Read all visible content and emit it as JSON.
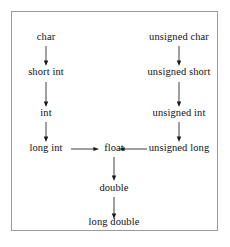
{
  "diagram": {
    "background_color": "#ffffff",
    "border_color": "#9a9a9a",
    "text_color": "#121212",
    "arrow_color": "#2a2a2a",
    "nodes": [
      {
        "id": "char",
        "label": "char",
        "x": 45,
        "y": 40,
        "column": "signed"
      },
      {
        "id": "short_int",
        "label": "short int",
        "x": 45,
        "y": 75,
        "column": "signed"
      },
      {
        "id": "int",
        "label": "int",
        "x": 45,
        "y": 116,
        "column": "signed"
      },
      {
        "id": "long_int",
        "label": "long int",
        "x": 45,
        "y": 151,
        "column": "signed"
      },
      {
        "id": "unsigned_char",
        "label": "unsigned char",
        "x": 178,
        "y": 40,
        "column": "unsigned"
      },
      {
        "id": "unsigned_short",
        "label": "unsigned short",
        "x": 178,
        "y": 75,
        "column": "unsigned"
      },
      {
        "id": "unsigned_int",
        "label": "unsigned int",
        "x": 178,
        "y": 116,
        "column": "unsigned"
      },
      {
        "id": "unsigned_long",
        "label": "unsigned long",
        "x": 178,
        "y": 151,
        "column": "unsigned"
      },
      {
        "id": "float",
        "label": "float",
        "x": 113,
        "y": 151,
        "column": "floating"
      },
      {
        "id": "double",
        "label": "double",
        "x": 113,
        "y": 191,
        "column": "floating"
      },
      {
        "id": "long_double",
        "label": "long double",
        "x": 113,
        "y": 225,
        "column": "floating"
      }
    ],
    "edges": [
      {
        "from": "char",
        "to": "short_int",
        "direction": "down",
        "x": 45,
        "y": 45,
        "length": 20
      },
      {
        "from": "short_int",
        "to": "int",
        "direction": "down",
        "x": 45,
        "y": 81,
        "length": 25
      },
      {
        "from": "int",
        "to": "long_int",
        "direction": "down",
        "x": 45,
        "y": 121,
        "length": 20
      },
      {
        "from": "unsigned_char",
        "to": "unsigned_short",
        "direction": "down",
        "x": 178,
        "y": 45,
        "length": 20
      },
      {
        "from": "unsigned_short",
        "to": "unsigned_int",
        "direction": "down",
        "x": 178,
        "y": 81,
        "length": 25
      },
      {
        "from": "unsigned_int",
        "to": "unsigned_long",
        "direction": "down",
        "x": 178,
        "y": 121,
        "length": 20
      },
      {
        "from": "long_int",
        "to": "float",
        "direction": "right",
        "x": 70,
        "y": 148,
        "length": 28
      },
      {
        "from": "unsigned_long",
        "to": "float",
        "direction": "left",
        "x": 118,
        "y": 148,
        "length": 28
      },
      {
        "from": "float",
        "to": "double",
        "direction": "down",
        "x": 113,
        "y": 156,
        "length": 24
      },
      {
        "from": "double",
        "to": "long_double",
        "direction": "down",
        "x": 113,
        "y": 196,
        "length": 22
      }
    ]
  }
}
